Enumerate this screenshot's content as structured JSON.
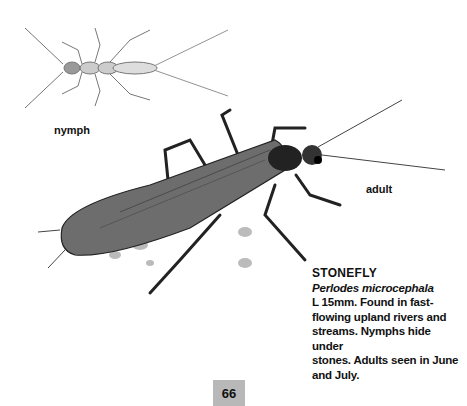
{
  "labels": {
    "nymph": "nymph",
    "adult": "adult"
  },
  "entry": {
    "title": "STONEFLY",
    "latin_name": "Perlodes microcephala",
    "description_lines": [
      "L 15mm. Found in fast-",
      "flowing upland rivers and",
      "streams. Nymphs hide under",
      "stones. Adults seen in June",
      "and July."
    ]
  },
  "page_number": "66",
  "illustrations": [
    {
      "name": "stonefly-nymph",
      "description": "grey pencil drawing of stonefly nymph with long antennae and tails"
    },
    {
      "name": "stonefly-adult",
      "description": "dark drawing of adult stonefly on pebbly surface"
    }
  ]
}
